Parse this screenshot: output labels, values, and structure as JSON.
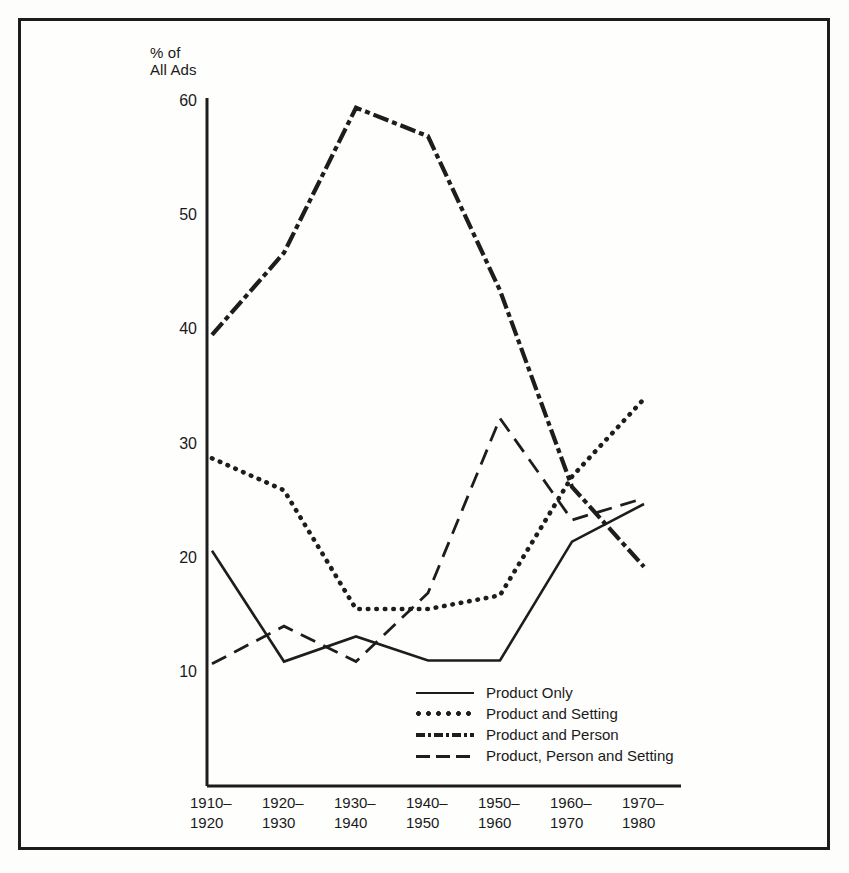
{
  "figure": {
    "border_color": "#1d1d1d",
    "background": "#fefefd"
  },
  "chart_data": {
    "type": "line",
    "title": "",
    "ylabel": "% of\nAll Ads",
    "xlabel": "",
    "ylim": [
      0,
      60
    ],
    "yticks": [
      10,
      20,
      30,
      40,
      50,
      60
    ],
    "ytick_labels": [
      "10",
      "20",
      "30",
      "40",
      "50",
      "60"
    ],
    "grid": false,
    "legend_position": "lower-center",
    "categories": [
      "1910–\n1920",
      "1920–\n1930",
      "1930–\n1940",
      "1940–\n1950",
      "1950–\n1960",
      "1960–\n1970",
      "1970–\n1980"
    ],
    "series": [
      {
        "name": "Product Only",
        "style": "solid",
        "color": "#1d1d1d",
        "values": [
          20.7,
          11.0,
          13.2,
          11.1,
          11.1,
          21.5,
          24.8
        ]
      },
      {
        "name": "Product and Setting",
        "style": "dotted",
        "color": "#1d1d1d",
        "values": [
          28.8,
          26.0,
          15.6,
          15.6,
          16.8,
          27.2,
          34.0
        ]
      },
      {
        "name": "Product and Person",
        "style": "dash-dot",
        "color": "#1d1d1d",
        "values": [
          39.6,
          46.8,
          59.5,
          57.0,
          43.5,
          26.3,
          19.3
        ]
      },
      {
        "name": "Product, Person and Setting",
        "style": "dashed",
        "color": "#1d1d1d",
        "values": [
          10.8,
          14.1,
          11.0,
          17.0,
          32.3,
          23.4,
          25.3
        ]
      }
    ]
  },
  "legend": {
    "entries": [
      {
        "label": "Product Only",
        "style": "solid"
      },
      {
        "label": "Product and Setting",
        "style": "dotted"
      },
      {
        "label": "Product and Person",
        "style": "dash-dot"
      },
      {
        "label": "Product, Person and Setting",
        "style": "dashed"
      }
    ]
  }
}
